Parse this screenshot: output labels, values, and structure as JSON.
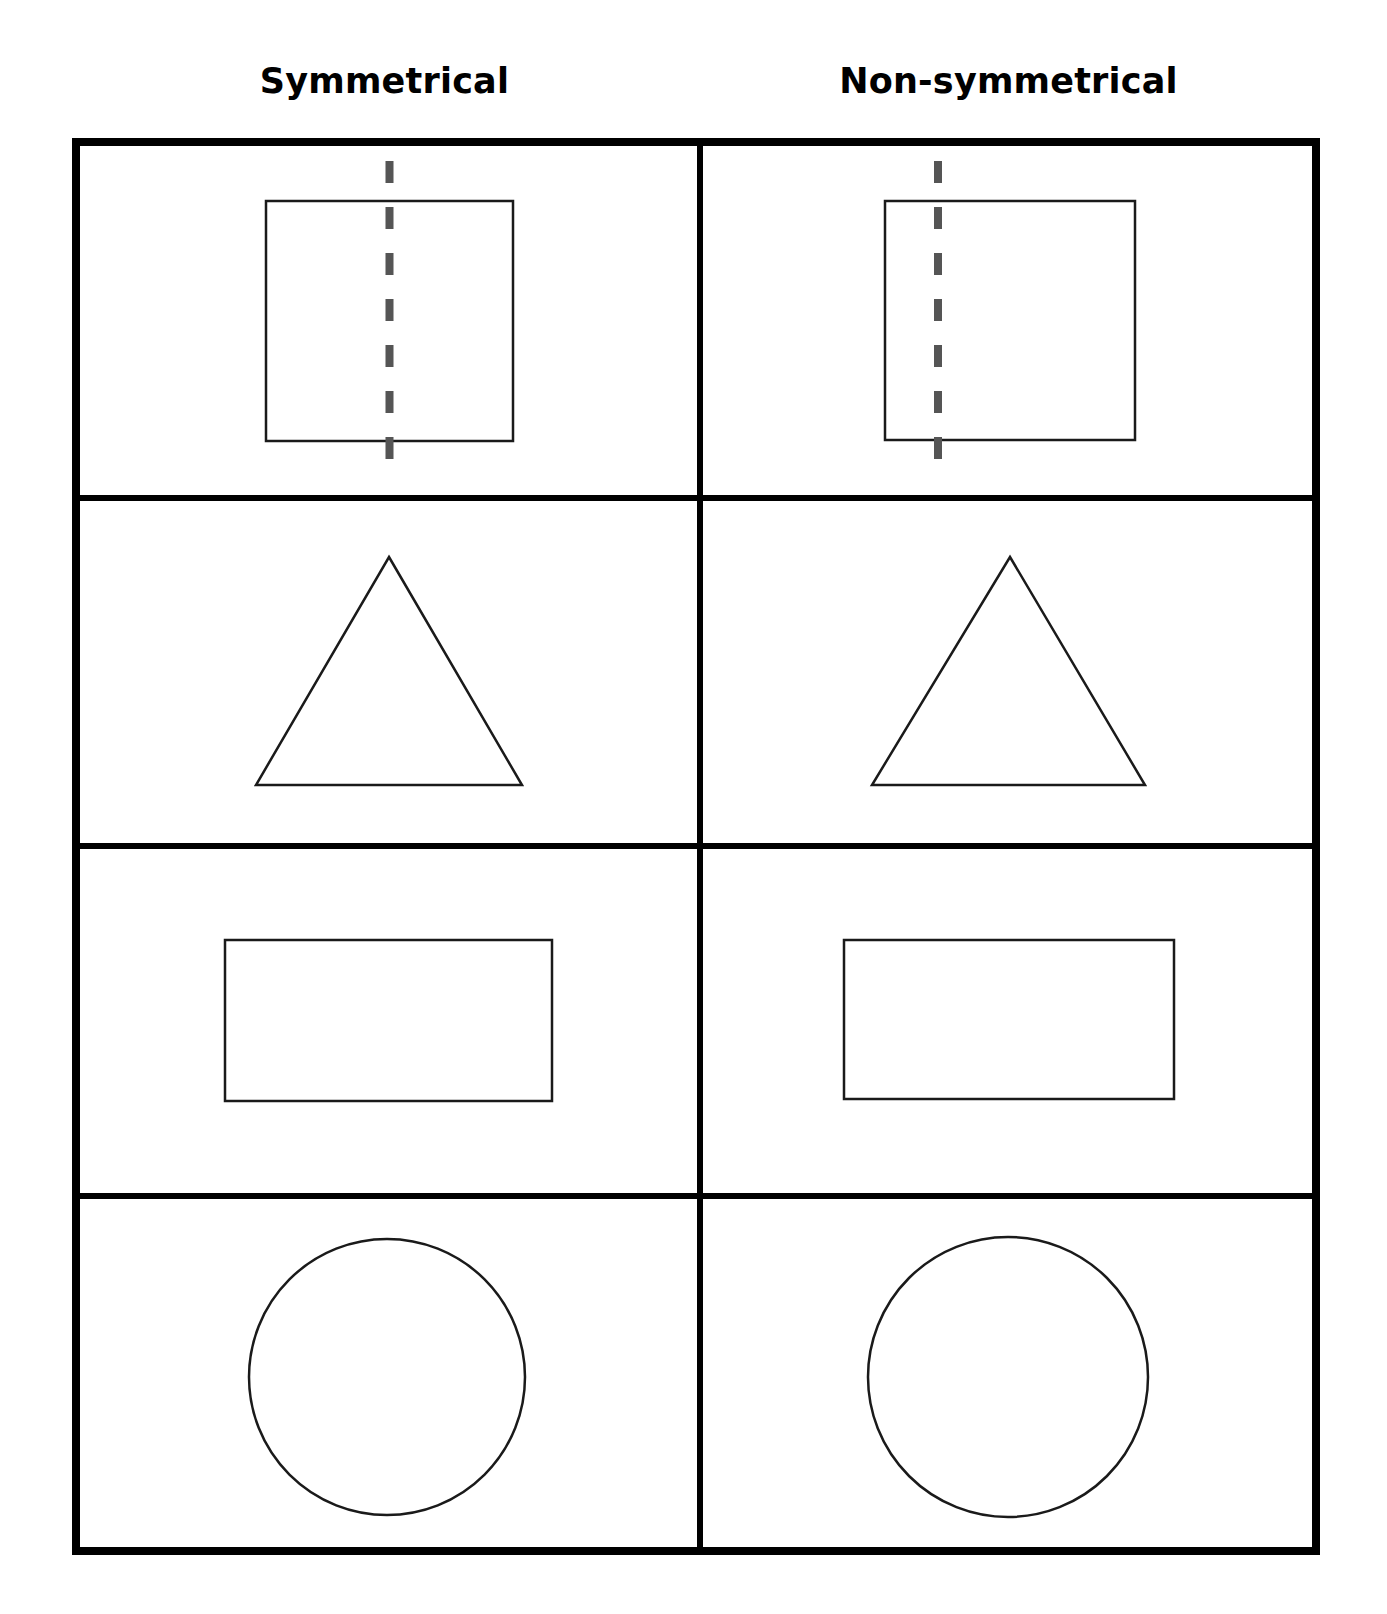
{
  "worksheet": {
    "title_visible": false,
    "background_color": "#ffffff",
    "frame_color": "#000000",
    "shape_outline_color": "#1a1a1a",
    "symmetry_line_color": "#555555"
  },
  "columns": [
    {
      "key": "symmetrical",
      "label": "Symmetrical"
    },
    {
      "key": "non_symmetrical",
      "label": "Non-symmetrical"
    }
  ],
  "rows": [
    {
      "row_index": 1,
      "shape": "square",
      "cells": [
        {
          "column": "symmetrical",
          "shape_name": "square",
          "has_dashed_line": true,
          "dashed_line_orientation": "vertical",
          "dashed_line_position": "center",
          "dashed_line_offset_percent": 50
        },
        {
          "column": "non_symmetrical",
          "shape_name": "square",
          "has_dashed_line": true,
          "dashed_line_orientation": "vertical",
          "dashed_line_position": "off-center-left",
          "dashed_line_offset_percent": 21
        }
      ]
    },
    {
      "row_index": 2,
      "shape": "triangle",
      "cells": [
        {
          "column": "symmetrical",
          "shape_name": "triangle",
          "has_dashed_line": false,
          "dashed_line_orientation": null,
          "dashed_line_position": null,
          "dashed_line_offset_percent": null
        },
        {
          "column": "non_symmetrical",
          "shape_name": "triangle",
          "has_dashed_line": false,
          "dashed_line_orientation": null,
          "dashed_line_position": null,
          "dashed_line_offset_percent": null
        }
      ]
    },
    {
      "row_index": 3,
      "shape": "rectangle",
      "cells": [
        {
          "column": "symmetrical",
          "shape_name": "rectangle",
          "has_dashed_line": false,
          "dashed_line_orientation": null,
          "dashed_line_position": null,
          "dashed_line_offset_percent": null
        },
        {
          "column": "non_symmetrical",
          "shape_name": "rectangle",
          "has_dashed_line": false,
          "dashed_line_orientation": null,
          "dashed_line_position": null,
          "dashed_line_offset_percent": null
        }
      ]
    },
    {
      "row_index": 4,
      "shape": "circle",
      "cells": [
        {
          "column": "symmetrical",
          "shape_name": "circle",
          "has_dashed_line": false,
          "dashed_line_orientation": null,
          "dashed_line_position": null,
          "dashed_line_offset_percent": null
        },
        {
          "column": "non_symmetrical",
          "shape_name": "circle",
          "has_dashed_line": false,
          "dashed_line_orientation": null,
          "dashed_line_position": null,
          "dashed_line_offset_percent": null
        }
      ]
    }
  ]
}
